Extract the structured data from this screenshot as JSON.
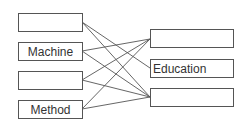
{
  "diagram": {
    "left_items": [
      {
        "label": ""
      },
      {
        "label": "Machine"
      },
      {
        "label": ""
      },
      {
        "label": "Method"
      }
    ],
    "right_items": [
      {
        "label": ""
      },
      {
        "label": "Education"
      },
      {
        "label": ""
      }
    ],
    "connections": [
      {
        "from": 0,
        "to": 1
      },
      {
        "from": 0,
        "to": 2
      },
      {
        "from": 1,
        "to": 0
      },
      {
        "from": 1,
        "to": 2
      },
      {
        "from": 2,
        "to": 0
      },
      {
        "from": 2,
        "to": 2
      },
      {
        "from": 3,
        "to": 0
      },
      {
        "from": 3,
        "to": 2
      }
    ],
    "line_color": "#555555"
  }
}
